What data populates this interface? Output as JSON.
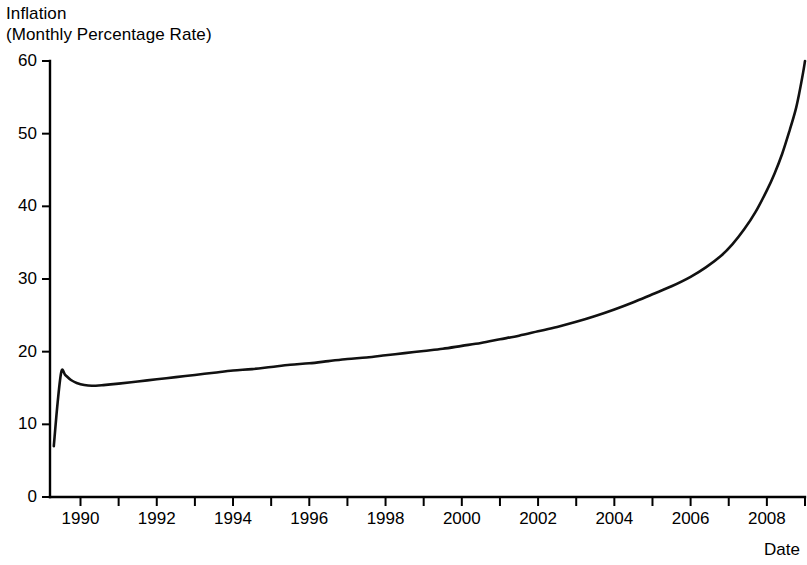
{
  "chart_data": {
    "type": "line",
    "title": "Inflation",
    "subtitle": "(Monthly Percentage Rate)",
    "xlabel": "Date",
    "ylabel": "",
    "grid": false,
    "legend": false,
    "xlim": [
      1989.2,
      2009.0
    ],
    "ylim": [
      0,
      60
    ],
    "x_ticks_labeled": [
      1990,
      1992,
      1994,
      1996,
      1998,
      2000,
      2002,
      2004,
      2006,
      2008
    ],
    "x_tick_labels": [
      "1990",
      "1992",
      "1994",
      "1996",
      "1998",
      "2000",
      "2002",
      "2004",
      "2006",
      "2008"
    ],
    "x_minor_ticks": [
      1990,
      1991,
      1992,
      1993,
      1994,
      1995,
      1996,
      1997,
      1998,
      1999,
      2000,
      2001,
      2002,
      2003,
      2004,
      2005,
      2006,
      2007,
      2008,
      2009
    ],
    "y_ticks": [
      0,
      10,
      20,
      30,
      40,
      50,
      60
    ],
    "y_tick_labels": [
      "0",
      "10",
      "20",
      "30",
      "40",
      "50",
      "60"
    ],
    "series": [
      {
        "name": "Inflation (Monthly Percentage Rate)",
        "color": "#111111",
        "x": [
          1989.3,
          1989.4,
          1989.5,
          1989.6,
          1989.75,
          1989.9,
          1990.1,
          1990.3,
          1990.6,
          1991.0,
          1991.5,
          1992.0,
          1992.5,
          1993.0,
          1993.5,
          1994.0,
          1994.5,
          1995.0,
          1995.5,
          1996.0,
          1996.5,
          1997.0,
          1997.5,
          1998.0,
          1998.5,
          1999.0,
          1999.5,
          2000.0,
          2000.5,
          2001.0,
          2001.5,
          2002.0,
          2002.5,
          2003.0,
          2003.5,
          2004.0,
          2004.5,
          2005.0,
          2005.5,
          2006.0,
          2006.4,
          2006.8,
          2007.1,
          2007.4,
          2007.7,
          2008.0,
          2008.2,
          2008.4,
          2008.6,
          2008.75,
          2008.85,
          2008.95,
          2009.0
        ],
        "y": [
          7.0,
          13.0,
          17.3,
          16.8,
          16.1,
          15.7,
          15.4,
          15.3,
          15.4,
          15.6,
          15.9,
          16.2,
          16.5,
          16.8,
          17.1,
          17.4,
          17.6,
          17.9,
          18.2,
          18.4,
          18.7,
          19.0,
          19.2,
          19.5,
          19.8,
          20.1,
          20.4,
          20.8,
          21.2,
          21.7,
          22.2,
          22.8,
          23.4,
          24.1,
          24.9,
          25.8,
          26.8,
          27.9,
          29.0,
          30.3,
          31.6,
          33.2,
          34.8,
          36.8,
          39.2,
          42.2,
          44.5,
          47.2,
          50.5,
          53.2,
          55.6,
          58.4,
          60.0
        ]
      }
    ]
  },
  "axes": {
    "y_axis_name": "inflation-axis",
    "x_axis_name": "date-axis"
  }
}
